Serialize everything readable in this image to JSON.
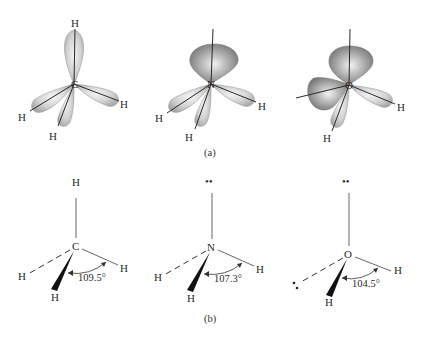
{
  "figure": {
    "part_a": {
      "caption": "(a)",
      "molecules": [
        {
          "name": "methane",
          "center_atom": "C",
          "labels": [
            "H",
            "H",
            "H",
            "H"
          ],
          "lone_pair_lobes": 0,
          "bond_lobes": 4
        },
        {
          "name": "ammonia",
          "center_atom": "N",
          "labels": [
            "H",
            "H",
            "H"
          ],
          "lone_pair_lobes": 1,
          "bond_lobes": 3
        },
        {
          "name": "water",
          "center_atom": "O",
          "labels": [
            "H",
            "H"
          ],
          "lone_pair_lobes": 2,
          "bond_lobes": 2
        }
      ]
    },
    "part_b": {
      "caption": "(b)",
      "molecules": [
        {
          "name": "methane",
          "center_atom": "C",
          "top": "H",
          "left": "H",
          "right": "H",
          "wedge": "H",
          "lone_pair_symbol": "",
          "angle": "109.5°"
        },
        {
          "name": "ammonia",
          "center_atom": "N",
          "top": "••",
          "left": "H",
          "right": "H",
          "wedge": "H",
          "angle": "107.3°"
        },
        {
          "name": "water",
          "center_atom": "O",
          "top": "••",
          "left": "••",
          "right": "H",
          "wedge": "H",
          "angle": "104.5°"
        }
      ]
    }
  },
  "colors": {
    "background": "#ffffff",
    "ink": "#2a2a2a",
    "lobe_light": "#e6e6e6",
    "lobe_dark": "#8c8c8c"
  }
}
